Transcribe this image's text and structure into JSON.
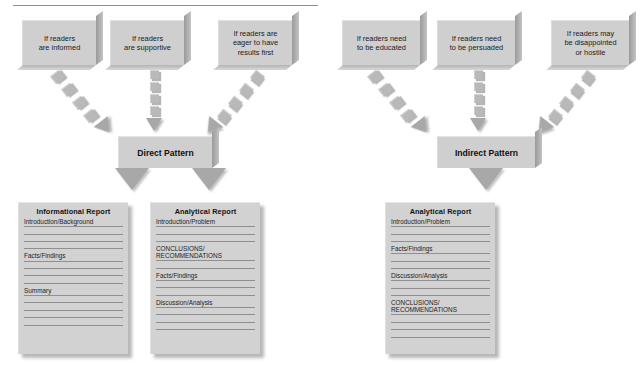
{
  "meta": {
    "colors": {
      "box_fill": "#cfcfcf",
      "arrow_fill": "#b9b9b9",
      "doc_fill": "#d2d2d2",
      "rule": "#8e8e8e",
      "text": "#111111"
    }
  },
  "left_group": {
    "pattern_label": "Direct Pattern",
    "conditions": [
      "If readers\nare informed",
      "If readers\nare supportive",
      "If readers are\neager to have\nresults first"
    ],
    "reports": [
      {
        "title": "Informational Report",
        "sections": [
          {
            "label": "Introduction/Background",
            "blank_lines": 3
          },
          {
            "label": "Facts/Findings",
            "blank_lines": 3
          },
          {
            "label": "Summary",
            "blank_lines": 4
          }
        ]
      },
      {
        "title": "Analytical Report",
        "sections": [
          {
            "label": "Introduction/Problem",
            "blank_lines": 2
          },
          {
            "label": "CONCLUSIONS/\nRECOMMENDATIONS",
            "blank_lines": 1
          },
          {
            "label": "Facts/Findings",
            "blank_lines": 2
          },
          {
            "label": "Discussion/Analysis",
            "blank_lines": 3
          }
        ]
      }
    ]
  },
  "right_group": {
    "pattern_label": "Indirect Pattern",
    "conditions": [
      "If readers need\nto be educated",
      "If readers need\nto be persuaded",
      "If readers may\nbe disappointed\nor hostile"
    ],
    "reports": [
      {
        "title": "Analytical Report",
        "sections": [
          {
            "label": "Introduction/Problem",
            "blank_lines": 2
          },
          {
            "label": "Facts/Findings",
            "blank_lines": 2
          },
          {
            "label": "Discussion/Analysis",
            "blank_lines": 2
          },
          {
            "label": "CONCLUSIONS/\nRECOMMENDATIONS",
            "blank_lines": 3
          }
        ]
      }
    ]
  }
}
